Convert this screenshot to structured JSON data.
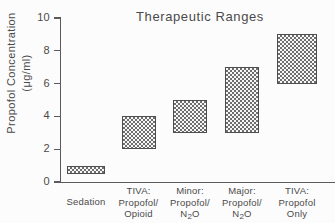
{
  "chart_data": {
    "type": "bar",
    "title": "Therapeutic Ranges",
    "xlabel": "",
    "ylabel_line1": "Propofol Concentration",
    "ylabel_line2_pre": "(",
    "ylabel_line2_unit": "μg/ml",
    "ylabel_line2_post": ")",
    "ylabel": "Propofol Concentration (μg/ml)",
    "ylim": [
      0,
      10
    ],
    "yticks": [
      "0",
      "2",
      "4",
      "6",
      "8",
      "10"
    ],
    "ytick_values": [
      0,
      2,
      4,
      6,
      8,
      10
    ],
    "grid": false,
    "legend": "none",
    "orientation": "vertical",
    "bar_style": "floating range (low-high)",
    "categories": [
      "Sedation",
      "TIVA: Propofol/ Opioid",
      "Minor: Propofol/ N2O",
      "Major: Propofol/ N2O",
      "TIVA: Propofol Only"
    ],
    "series": [
      {
        "name": "Therapeutic range (μg/ml)",
        "low": [
          0.5,
          2.0,
          3.0,
          3.0,
          6.0
        ],
        "high": [
          1.0,
          4.0,
          5.0,
          7.0,
          9.0
        ]
      }
    ],
    "bars": [
      {
        "category": "Sedation",
        "low": 0.5,
        "high": 1.0
      },
      {
        "category": "TIVA: Propofol/ Opioid",
        "low": 2.0,
        "high": 4.0
      },
      {
        "category": "Minor: Propofol/ N2O",
        "low": 3.0,
        "high": 5.0
      },
      {
        "category": "Major: Propofol/ N2O",
        "low": 3.0,
        "high": 7.0
      },
      {
        "category": "TIVA: Propofol Only",
        "low": 6.0,
        "high": 9.0
      }
    ],
    "colors": {
      "axis": "#5b5b5b",
      "text": "#4a4a4a",
      "bar_border": "#4e4e4e",
      "bar_pattern_dark": "#6e6e6e",
      "bar_pattern_light": "#f7f7f7",
      "background": "#fcfcfc"
    }
  },
  "xlabels": [
    {
      "l1": "Sedation",
      "l2": "",
      "l3": ""
    },
    {
      "l1": "TIVA:",
      "l2": "Propofol/",
      "l3": "Opioid"
    },
    {
      "l1": "Minor:",
      "l2": "Propofol/",
      "l3": "N",
      "l3sub": "2",
      "l3post": "O"
    },
    {
      "l1": "Major:",
      "l2": "Propofol/",
      "l3": "N",
      "l3sub": "2",
      "l3post": "O"
    },
    {
      "l1": "TIVA:",
      "l2": "Propofol",
      "l3": "Only"
    }
  ]
}
